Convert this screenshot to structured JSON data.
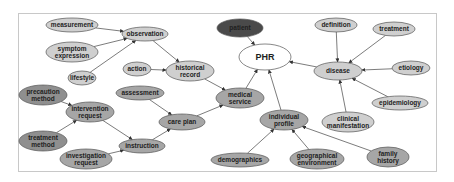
{
  "diagram": {
    "colors": {
      "light": "#cfcfcf",
      "medium": "#a6a6a6",
      "mediumDark": "#8f8f8f",
      "dark": "#4a4a4a",
      "white": "#ffffff",
      "stroke": "#555555",
      "edge": "#5a5a5a"
    },
    "nodes": [
      {
        "id": "measurement",
        "lines": [
          "measurement"
        ],
        "x": 72,
        "y": 25,
        "rx": 26,
        "ry": 7,
        "tone": "light"
      },
      {
        "id": "observation",
        "lines": [
          "observation"
        ],
        "x": 145,
        "y": 34,
        "rx": 23,
        "ry": 7,
        "tone": "light"
      },
      {
        "id": "symptom_expression",
        "lines": [
          "symptom",
          "expression"
        ],
        "x": 72,
        "y": 52,
        "rx": 26,
        "ry": 10,
        "tone": "light"
      },
      {
        "id": "lifestyle",
        "lines": [
          "lifestyle"
        ],
        "x": 82,
        "y": 78,
        "rx": 14,
        "ry": 7,
        "tone": "light"
      },
      {
        "id": "action",
        "lines": [
          "action"
        ],
        "x": 137,
        "y": 69,
        "rx": 14,
        "ry": 7,
        "tone": "light"
      },
      {
        "id": "historical_record",
        "lines": [
          "historical",
          "record"
        ],
        "x": 190,
        "y": 71,
        "rx": 24,
        "ry": 10,
        "tone": "light"
      },
      {
        "id": "patient",
        "lines": [
          "patient"
        ],
        "x": 240,
        "y": 28,
        "rx": 23,
        "ry": 9,
        "tone": "dark"
      },
      {
        "id": "PHR",
        "lines": [
          "PHR"
        ],
        "x": 265,
        "y": 57,
        "rx": 26,
        "ry": 13,
        "tone": "white"
      },
      {
        "id": "precaution_method",
        "lines": [
          "precaution",
          "method"
        ],
        "x": 43,
        "y": 95,
        "rx": 24,
        "ry": 10,
        "tone": "mediumDark"
      },
      {
        "id": "intervention_request",
        "lines": [
          "intervention",
          "request"
        ],
        "x": 90,
        "y": 112,
        "rx": 24,
        "ry": 10,
        "tone": "medium"
      },
      {
        "id": "assessment",
        "lines": [
          "assessment"
        ],
        "x": 140,
        "y": 93,
        "rx": 24,
        "ry": 7,
        "tone": "medium"
      },
      {
        "id": "care_plan",
        "lines": [
          "care plan"
        ],
        "x": 182,
        "y": 122,
        "rx": 23,
        "ry": 8,
        "tone": "medium"
      },
      {
        "id": "medical_service",
        "lines": [
          "medical",
          "service"
        ],
        "x": 240,
        "y": 98,
        "rx": 24,
        "ry": 10,
        "tone": "medium"
      },
      {
        "id": "treatment_method",
        "lines": [
          "treatment",
          "method"
        ],
        "x": 43,
        "y": 141,
        "rx": 24,
        "ry": 10,
        "tone": "mediumDark"
      },
      {
        "id": "instruction",
        "lines": [
          "instruction"
        ],
        "x": 142,
        "y": 146,
        "rx": 23,
        "ry": 7,
        "tone": "medium"
      },
      {
        "id": "investigation_request",
        "lines": [
          "investigation",
          "request"
        ],
        "x": 86,
        "y": 159,
        "rx": 26,
        "ry": 10,
        "tone": "medium"
      },
      {
        "id": "definition",
        "lines": [
          "definition"
        ],
        "x": 336,
        "y": 25,
        "rx": 21,
        "ry": 7,
        "tone": "light"
      },
      {
        "id": "treatment",
        "lines": [
          "treatment"
        ],
        "x": 394,
        "y": 29,
        "rx": 21,
        "ry": 7,
        "tone": "light"
      },
      {
        "id": "disease",
        "lines": [
          "disease"
        ],
        "x": 338,
        "y": 71,
        "rx": 24,
        "ry": 9,
        "tone": "light"
      },
      {
        "id": "etiology",
        "lines": [
          "etiology"
        ],
        "x": 411,
        "y": 68,
        "rx": 19,
        "ry": 7,
        "tone": "light"
      },
      {
        "id": "epidemiology",
        "lines": [
          "epidemiology"
        ],
        "x": 400,
        "y": 103,
        "rx": 28,
        "ry": 7,
        "tone": "light"
      },
      {
        "id": "clinical_manifestation",
        "lines": [
          "clinical",
          "manifestation"
        ],
        "x": 348,
        "y": 122,
        "rx": 26,
        "ry": 10,
        "tone": "light"
      },
      {
        "id": "individual_profile",
        "lines": [
          "individual",
          "profile"
        ],
        "x": 284,
        "y": 120,
        "rx": 24,
        "ry": 10,
        "tone": "medium"
      },
      {
        "id": "demographics",
        "lines": [
          "demographics"
        ],
        "x": 240,
        "y": 160,
        "rx": 29,
        "ry": 7,
        "tone": "medium"
      },
      {
        "id": "geographical_environment",
        "lines": [
          "geographical",
          "environment"
        ],
        "x": 317,
        "y": 159,
        "rx": 27,
        "ry": 10,
        "tone": "medium"
      },
      {
        "id": "family_history",
        "lines": [
          "family",
          "history"
        ],
        "x": 388,
        "y": 157,
        "rx": 21,
        "ry": 10,
        "tone": "medium"
      }
    ],
    "edges": [
      [
        "measurement",
        "observation"
      ],
      [
        "symptom_expression",
        "observation"
      ],
      [
        "lifestyle",
        "observation"
      ],
      [
        "observation",
        "historical_record"
      ],
      [
        "action",
        "historical_record"
      ],
      [
        "historical_record",
        "medical_service"
      ],
      [
        "patient",
        "PHR"
      ],
      [
        "medical_service",
        "PHR"
      ],
      [
        "individual_profile",
        "PHR"
      ],
      [
        "disease",
        "PHR"
      ],
      [
        "precaution_method",
        "intervention_request"
      ],
      [
        "treatment_method",
        "intervention_request"
      ],
      [
        "intervention_request",
        "instruction"
      ],
      [
        "investigation_request",
        "instruction"
      ],
      [
        "instruction",
        "care_plan"
      ],
      [
        "assessment",
        "care_plan"
      ],
      [
        "care_plan",
        "medical_service"
      ],
      [
        "definition",
        "disease"
      ],
      [
        "treatment",
        "disease"
      ],
      [
        "etiology",
        "disease"
      ],
      [
        "epidemiology",
        "disease"
      ],
      [
        "clinical_manifestation",
        "disease"
      ],
      [
        "demographics",
        "individual_profile"
      ],
      [
        "geographical_environment",
        "individual_profile"
      ],
      [
        "family_history",
        "individual_profile"
      ]
    ]
  }
}
